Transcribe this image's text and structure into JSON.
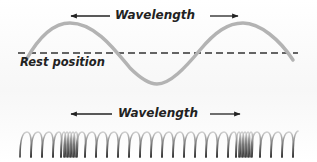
{
  "diagram": {
    "transverse": {
      "wavelength_label": "Wavelength",
      "rest_label": "Rest position",
      "wave_color": "#b3b3b3",
      "rest_line_color": "#333333"
    },
    "longitudinal": {
      "wavelength_label": "Wavelength",
      "spring_color": "#555555"
    }
  }
}
